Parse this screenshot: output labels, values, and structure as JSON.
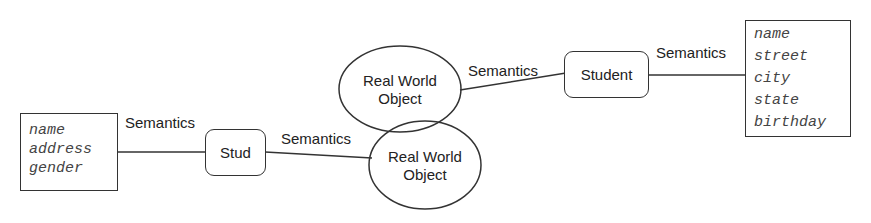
{
  "diagram": {
    "left_attributes": [
      "name",
      "address",
      "gender"
    ],
    "right_attributes": [
      "name",
      "street",
      "city",
      "state",
      "birthday"
    ],
    "nodes": {
      "stud": "Stud",
      "student": "Student",
      "rwo_top_line1": "Real World",
      "rwo_top_line2": "Object",
      "rwo_bottom_line1": "Real World",
      "rwo_bottom_line2": "Object"
    },
    "edges": {
      "attrs_to_stud": "Semantics",
      "stud_to_rwo": "Semantics",
      "rwo_to_student": "Semantics",
      "student_to_attrs": "Semantics"
    },
    "colors": {
      "stroke": "#333333",
      "text": "#222222",
      "attr_text": "#444444"
    }
  }
}
